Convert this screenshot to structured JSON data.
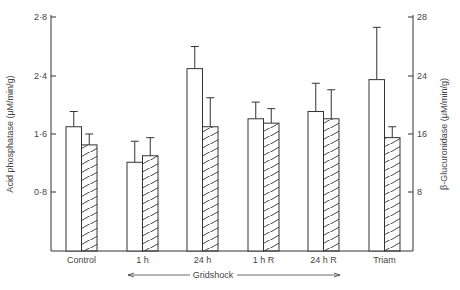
{
  "chart_data": {
    "type": "bar",
    "title": "",
    "categories": [
      "Control",
      "1 h",
      "24 h",
      "1 h R",
      "24 h R",
      "Triam"
    ],
    "group_annotation": {
      "label": "Gridshock",
      "spans": [
        "1 h",
        "24 h R"
      ],
      "style": "double-arrow"
    },
    "series": [
      {
        "name": "Acid phosphatase",
        "axis": "left",
        "fill": "open",
        "values": [
          1.7,
          1.21,
          2.45,
          1.81,
          1.91,
          2.35
        ],
        "error_upper": [
          1.91,
          1.5,
          2.6,
          2.04,
          2.3,
          2.73
        ]
      },
      {
        "name": "β-Glucuronidase",
        "axis": "right",
        "fill": "hatched",
        "values": [
          14.5,
          13.0,
          17.0,
          17.5,
          18.1,
          15.5
        ],
        "error_upper": [
          16.0,
          15.5,
          21.0,
          19.5,
          22.1,
          17.0
        ]
      }
    ],
    "ylabel": "Acid phosphatase (μM/min/g)",
    "ylabel_right": "β-Glucuronidase (μM/min/g)",
    "yticks_left": [
      "0·8",
      "1·6",
      "2·4",
      "2·8"
    ],
    "yticks_left_values": [
      0.8,
      1.6,
      2.4,
      2.8
    ],
    "yticks_right": [
      "8",
      "16",
      "24",
      "28"
    ],
    "yticks_right_values": [
      8,
      16,
      24,
      28
    ],
    "ylim_left": [
      0,
      2.8
    ],
    "ylim_right": [
      0,
      28
    ],
    "grid": false,
    "legend": "none"
  }
}
